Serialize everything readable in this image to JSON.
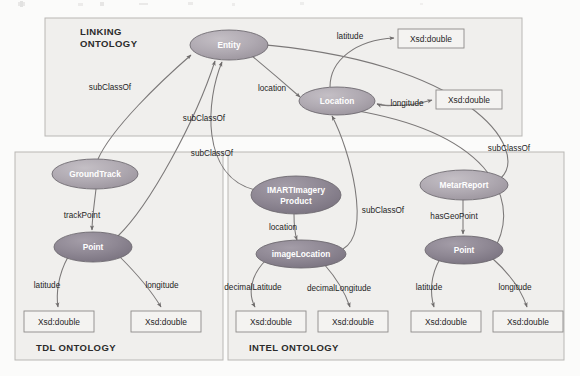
{
  "diagram": {
    "title_visible": false,
    "canvas": {
      "width": 580,
      "height": 376,
      "background": "#fbfbfa"
    },
    "colors": {
      "box_fill": "#f0efed",
      "box_stroke": "#b9b7b4",
      "ellipse_fill_light": "#b3adb4",
      "ellipse_fill_dark": "#8d8791",
      "ellipse_stroke": "#6e6a70",
      "literal_fill": "#f4f3f1",
      "literal_stroke": "#8d8b89",
      "edge_stroke": "#7b7878",
      "node_text": "#ffffff",
      "label_text": "#1e1e1e"
    },
    "ontologies": [
      {
        "id": "linking",
        "label": "LINKING\nONTOLOGY",
        "label_line1": "LINKING",
        "label_line2": "ONTOLOGY",
        "x": 45,
        "y": 18,
        "w": 477,
        "h": 118,
        "label_pos": "top-left"
      },
      {
        "id": "tdl",
        "label": "TDL ONTOLOGY",
        "x": 15,
        "y": 152,
        "w": 208,
        "h": 208,
        "label_pos": "bottom-left"
      },
      {
        "id": "intel",
        "label": "INTEL ONTOLOGY",
        "x": 228,
        "y": 152,
        "w": 336,
        "h": 208,
        "label_pos": "bottom-left"
      }
    ],
    "nodes": [
      {
        "id": "entity",
        "label": "Entity",
        "lines": [
          "Entity"
        ],
        "cx": 229,
        "cy": 45,
        "rx": 39,
        "ry": 15,
        "shade": "light"
      },
      {
        "id": "location",
        "label": "Location",
        "cx": 337,
        "cy": 101,
        "rx": 38,
        "ry": 14,
        "shade": "light"
      },
      {
        "id": "groundtrack",
        "label": "GroundTrack",
        "cx": 95,
        "cy": 174,
        "rx": 43,
        "ry": 15,
        "shade": "light"
      },
      {
        "id": "tdl_point",
        "label": "Point",
        "cx": 93,
        "cy": 247,
        "rx": 39,
        "ry": 15,
        "shade": "dark"
      },
      {
        "id": "imart",
        "label": "IMARTImagery Product",
        "lines": [
          "IMARTImagery",
          "Product"
        ],
        "cx": 296,
        "cy": 195,
        "rx": 45,
        "ry": 19,
        "shade": "dark"
      },
      {
        "id": "imagelocation",
        "label": "imageLocation",
        "cx": 301,
        "cy": 254,
        "rx": 45,
        "ry": 14,
        "shade": "dark"
      },
      {
        "id": "metarreport",
        "label": "MetarReport",
        "cx": 464,
        "cy": 185,
        "rx": 44,
        "ry": 15,
        "shade": "light"
      },
      {
        "id": "intel_point",
        "label": "Point",
        "cx": 464,
        "cy": 250,
        "rx": 39,
        "ry": 14,
        "shade": "dark"
      }
    ],
    "literals": [
      {
        "id": "lit_lat_linking",
        "label": "Xsd:double",
        "x": 398,
        "y": 29,
        "w": 66,
        "h": 19
      },
      {
        "id": "lit_lon_linking",
        "label": "Xsd:double",
        "x": 436,
        "y": 90,
        "w": 66,
        "h": 19
      },
      {
        "id": "lit_tdl_lat",
        "label": "Xsd:double",
        "x": 24,
        "y": 311,
        "w": 70,
        "h": 21
      },
      {
        "id": "lit_tdl_lon",
        "label": "Xsd:double",
        "x": 131,
        "y": 311,
        "w": 70,
        "h": 21
      },
      {
        "id": "lit_intel_declat",
        "label": "Xsd:double",
        "x": 236,
        "y": 311,
        "w": 70,
        "h": 21
      },
      {
        "id": "lit_intel_declon",
        "label": "Xsd:double",
        "x": 318,
        "y": 311,
        "w": 70,
        "h": 21
      },
      {
        "id": "lit_intel_lat",
        "label": "Xsd:double",
        "x": 411,
        "y": 311,
        "w": 70,
        "h": 21
      },
      {
        "id": "lit_intel_lon",
        "label": "Xsd:double",
        "x": 493,
        "y": 311,
        "w": 70,
        "h": 21
      }
    ],
    "edges": [
      {
        "id": "e_gt_entity",
        "from": "groundtrack",
        "to": "entity",
        "label": "subClassOf",
        "lx": 110,
        "ly": 87
      },
      {
        "id": "e_tdlpoint_location",
        "from": "tdl_point",
        "to": "location",
        "label": "subClassOf",
        "lx": 204,
        "ly": 118
      },
      {
        "id": "e_entity_location",
        "from": "entity",
        "to": "location",
        "label": "location",
        "lx": 272,
        "ly": 88
      },
      {
        "id": "e_location_latitude",
        "from": "location",
        "to": "lit_lat_linking",
        "label": "latitude",
        "lx": 348,
        "ly": 36
      },
      {
        "id": "e_location_longitude",
        "from": "location",
        "to": "lit_lon_linking",
        "label": "longitude",
        "lx": 404,
        "ly": 103
      },
      {
        "id": "e_gt_trackpoint",
        "from": "groundtrack",
        "to": "tdl_point",
        "label": "trackPoint",
        "lx": 82,
        "ly": 215
      },
      {
        "id": "e_tdlpoint_lat",
        "from": "tdl_point",
        "to": "lit_tdl_lat",
        "label": "latitude",
        "lx": 47,
        "ly": 285
      },
      {
        "id": "e_tdlpoint_lon",
        "from": "tdl_point",
        "to": "lit_tdl_lon",
        "label": "longitude",
        "lx": 160,
        "ly": 285
      },
      {
        "id": "e_imart_entity",
        "from": "imart",
        "to": "entity",
        "label": "subClassOf",
        "lx": 212,
        "ly": 153
      },
      {
        "id": "e_imart_location",
        "from": "imart",
        "to": "imagelocation",
        "label": "location",
        "lx": 283,
        "ly": 227
      },
      {
        "id": "e_imageloc_location",
        "from": "imagelocation",
        "to": "location",
        "label": "subClassOf",
        "lx": 383,
        "ly": 210
      },
      {
        "id": "e_imageloc_declat",
        "from": "imagelocation",
        "to": "lit_intel_declat",
        "label": "decimalLatitude",
        "lx": 253,
        "ly": 287
      },
      {
        "id": "e_imageloc_declon",
        "from": "imagelocation",
        "to": "lit_intel_declon",
        "label": "decimalLongitude",
        "lx": 337,
        "ly": 288
      },
      {
        "id": "e_metar_entity",
        "from": "metarreport",
        "to": "entity",
        "label": "subClassOf",
        "lx": 509,
        "ly": 148
      },
      {
        "id": "e_metar_geopoint",
        "from": "metarreport",
        "to": "intel_point",
        "label": "hasGeoPoint",
        "lx": 454,
        "ly": 216
      },
      {
        "id": "e_intelpoint_lat",
        "from": "intel_point",
        "to": "lit_intel_lat",
        "label": "latitude",
        "lx": 429,
        "ly": 287
      },
      {
        "id": "e_intelpoint_lon",
        "from": "intel_point",
        "to": "lit_intel_lon",
        "label": "longitude",
        "lx": 513,
        "ly": 287
      },
      {
        "id": "e_intelpoint_location",
        "from": "intel_point",
        "to": "location",
        "label": "",
        "lx": 0,
        "ly": 0
      }
    ]
  }
}
